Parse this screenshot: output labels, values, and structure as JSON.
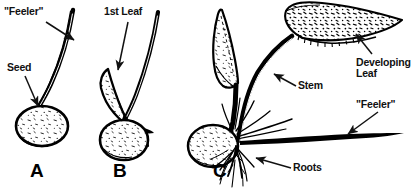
{
  "figure": {
    "background_color": "#ffffff",
    "ink_color": "#000000",
    "width": 412,
    "height": 189
  },
  "labels": {
    "feeler_a": "\"Feeler\"",
    "seed": "Seed",
    "first_leaf": "1st Leaf",
    "developing_leaf": "Developing\nLeaf",
    "feeler_c": "\"Feeler\"",
    "stem": "Stem",
    "roots": "Roots"
  },
  "panels": [
    {
      "letter": "A",
      "caption": "A",
      "parts": [
        "Seed",
        "\"Feeler\""
      ]
    },
    {
      "letter": "B",
      "caption": "B",
      "parts": [
        "1st Leaf"
      ]
    },
    {
      "letter": "C",
      "caption": "C",
      "parts": [
        "Developing Leaf",
        "Stem",
        "\"Feeler\"",
        "Roots"
      ]
    }
  ]
}
